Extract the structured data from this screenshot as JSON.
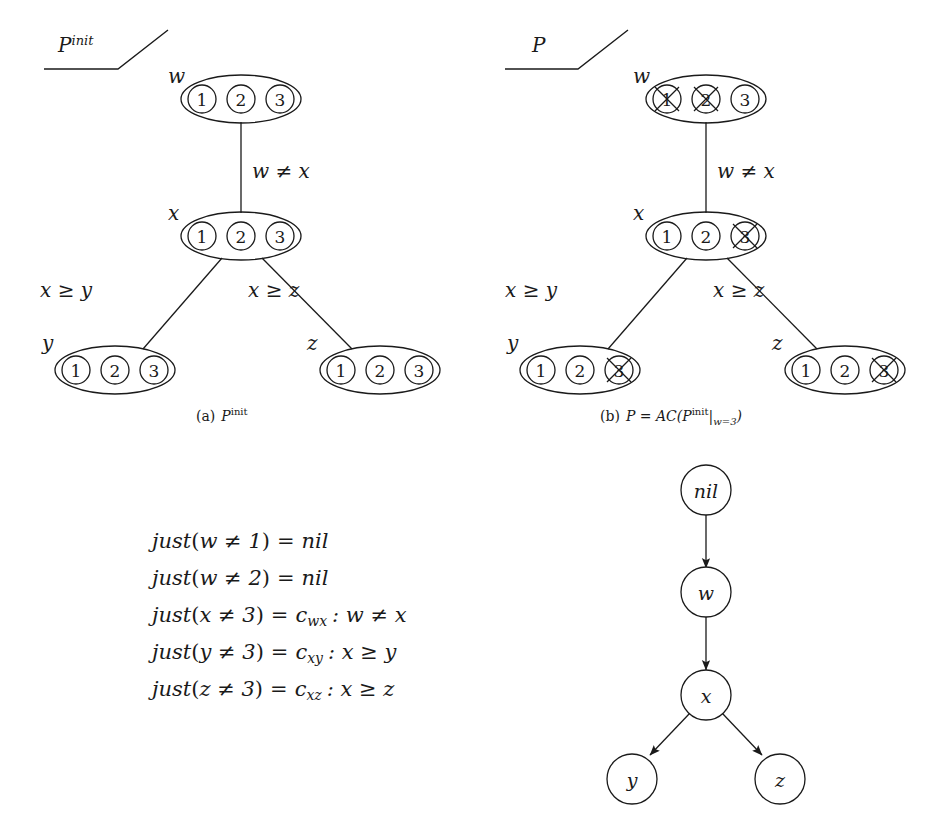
{
  "figure": {
    "panels": [
      {
        "id": "a",
        "marker_label": "P",
        "marker_sup": "init",
        "caption_prefix": "(a)",
        "caption_main": "P",
        "caption_sup": "init",
        "nodes": [
          {
            "name": "w",
            "label": "w",
            "values": [
              "1",
              "2",
              "3"
            ],
            "crossed": [
              false,
              false,
              false
            ]
          },
          {
            "name": "x",
            "label": "x",
            "values": [
              "1",
              "2",
              "3"
            ],
            "crossed": [
              false,
              false,
              false
            ]
          },
          {
            "name": "y",
            "label": "y",
            "values": [
              "1",
              "2",
              "3"
            ],
            "crossed": [
              false,
              false,
              false
            ]
          },
          {
            "name": "z",
            "label": "z",
            "values": [
              "1",
              "2",
              "3"
            ],
            "crossed": [
              false,
              false,
              false
            ]
          }
        ],
        "edges": [
          {
            "from": "w",
            "to": "x",
            "label": "w ≠ x"
          },
          {
            "from": "x",
            "to": "y",
            "label": "x ≥ y"
          },
          {
            "from": "x",
            "to": "z",
            "label": "x ≥ z"
          }
        ]
      },
      {
        "id": "b",
        "marker_label": "P",
        "marker_sup": "",
        "caption_prefix": "(b)",
        "caption_main": "P = AC(P",
        "caption_sup": "init",
        "caption_tail": "|",
        "caption_sub": "w=3",
        "caption_close": ")",
        "nodes": [
          {
            "name": "w",
            "label": "w",
            "values": [
              "1",
              "2",
              "3"
            ],
            "crossed": [
              true,
              true,
              false
            ]
          },
          {
            "name": "x",
            "label": "x",
            "values": [
              "1",
              "2",
              "3"
            ],
            "crossed": [
              false,
              false,
              true
            ]
          },
          {
            "name": "y",
            "label": "y",
            "values": [
              "1",
              "2",
              "3"
            ],
            "crossed": [
              false,
              false,
              true
            ]
          },
          {
            "name": "z",
            "label": "z",
            "values": [
              "1",
              "2",
              "3"
            ],
            "crossed": [
              false,
              false,
              true
            ]
          }
        ],
        "edges": [
          {
            "from": "w",
            "to": "x",
            "label": "w ≠ x"
          },
          {
            "from": "x",
            "to": "y",
            "label": "x ≥ y"
          },
          {
            "from": "x",
            "to": "z",
            "label": "x ≥ z"
          }
        ]
      }
    ],
    "justifications": {
      "lines": [
        {
          "fn": "just",
          "arg": "w ≠ 1",
          "eq": "=",
          "rhs": "nil",
          "rhs_sub": "",
          "cond": ""
        },
        {
          "fn": "just",
          "arg": "w ≠ 2",
          "eq": "=",
          "rhs": "nil",
          "rhs_sub": "",
          "cond": ""
        },
        {
          "fn": "just",
          "arg": "x ≠ 3",
          "eq": "=",
          "rhs": "c",
          "rhs_sub": "wx",
          "cond": ": w ≠ x"
        },
        {
          "fn": "just",
          "arg": "y ≠ 3",
          "eq": "=",
          "rhs": "c",
          "rhs_sub": "xy",
          "cond": ": x ≥ y"
        },
        {
          "fn": "just",
          "arg": "z ≠ 3",
          "eq": "=",
          "rhs": "c",
          "rhs_sub": "xz",
          "cond": ": x ≥ z"
        }
      ]
    },
    "implication_graph": {
      "nodes": [
        {
          "id": "nil",
          "label": "nil"
        },
        {
          "id": "w",
          "label": "w"
        },
        {
          "id": "x",
          "label": "x"
        },
        {
          "id": "y",
          "label": "y"
        },
        {
          "id": "z",
          "label": "z"
        }
      ],
      "edges": [
        {
          "from": "nil",
          "to": "w"
        },
        {
          "from": "w",
          "to": "x"
        },
        {
          "from": "x",
          "to": "y"
        },
        {
          "from": "x",
          "to": "z"
        }
      ]
    },
    "colors": {
      "stroke": "#1a1a1a",
      "background": "#ffffff"
    }
  }
}
